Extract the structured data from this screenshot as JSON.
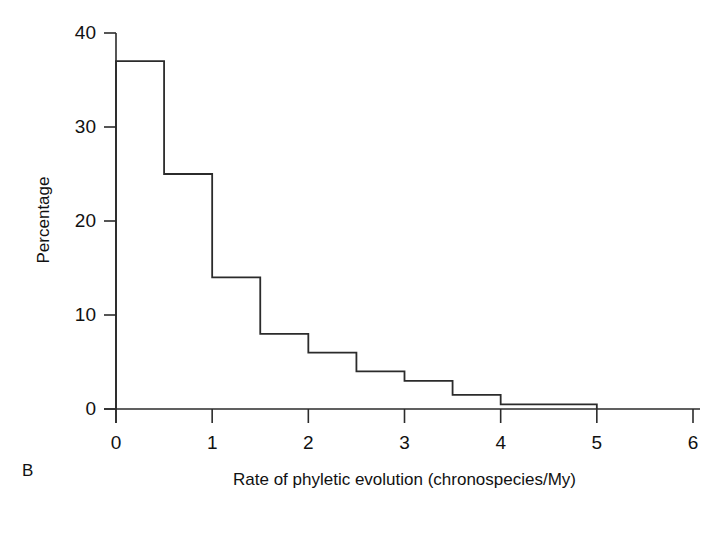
{
  "figure": {
    "panel_label": "B",
    "ylabel": "Percentage",
    "xlabel": "Rate of phyletic evolution (chronospecies/My)",
    "line_color": "#2b2b2b",
    "background": "#ffffff"
  },
  "axes": {
    "y_ticks": [
      "0",
      "10",
      "20",
      "30",
      "40"
    ],
    "x_ticks": [
      "0",
      "1",
      "2",
      "3",
      "4",
      "5",
      "6"
    ]
  },
  "chart_data": {
    "type": "bar",
    "title": "",
    "subtitle": "",
    "xlabel": "Rate of phyletic evolution (chronospecies/My)",
    "ylabel": "Percentage",
    "xlim": [
      0,
      6
    ],
    "ylim": [
      0,
      40
    ],
    "grid": false,
    "legend": "none",
    "annotations": [
      "B"
    ],
    "bin_width": 0.5,
    "bin_edges": [
      0,
      0.5,
      1,
      1.5,
      2,
      2.5,
      3,
      3.5,
      4,
      4.5,
      5
    ],
    "categories": [
      "0-0.5",
      "0.5-1",
      "1-1.5",
      "1.5-2",
      "2-2.5",
      "2.5-3",
      "3-3.5",
      "3.5-4",
      "4-4.5",
      "4.5-5"
    ],
    "values": [
      37,
      25,
      14,
      8,
      6,
      4,
      3,
      1.5,
      0.5,
      0.5
    ],
    "x_tick_values": [
      0,
      1,
      2,
      3,
      4,
      5,
      6
    ],
    "y_tick_values": [
      0,
      10,
      20,
      30,
      40
    ],
    "style": "step-outline-histogram"
  }
}
